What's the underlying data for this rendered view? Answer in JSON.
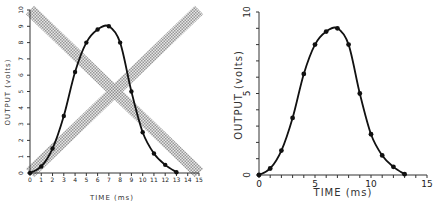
{
  "chart_data": [
    {
      "type": "line",
      "title": "",
      "xlabel": "TIME (ms)",
      "ylabel": "OUTPUT (volts)",
      "xlim": [
        0,
        15
      ],
      "ylim": [
        0,
        10
      ],
      "xticks": [
        "0",
        "1",
        "2",
        "3",
        "4",
        "5",
        "6",
        "7",
        "8",
        "9",
        "10",
        "11",
        "12",
        "13",
        "14",
        "15"
      ],
      "yticks": [
        "0",
        "1",
        "2",
        "3",
        "4",
        "5",
        "6",
        "7",
        "8",
        "9",
        "10"
      ],
      "grid": false,
      "annotations": [
        "Two crossing gray hatched diagonal bands overlaid (X shape): one from (0,10) to (15,0), one from (0,0) to (15,10)"
      ],
      "x": [
        0,
        1,
        2,
        3,
        4,
        5,
        6,
        7,
        8,
        9,
        10,
        11,
        12,
        13
      ],
      "series": [
        {
          "name": "output",
          "values": [
            0,
            0.4,
            1.5,
            3.5,
            6.2,
            8.0,
            8.8,
            9.0,
            8.0,
            5.0,
            2.5,
            1.2,
            0.5,
            0.05
          ]
        }
      ]
    },
    {
      "type": "line",
      "title": "",
      "xlabel": "TIME (ms)",
      "ylabel": "OUTPUT (volts)",
      "xlim": [
        0,
        15
      ],
      "ylim": [
        0,
        10
      ],
      "xticks": [
        "0",
        "5",
        "10",
        "15"
      ],
      "yticks": [
        "0",
        "5",
        "10"
      ],
      "grid": false,
      "x": [
        0,
        1,
        2,
        3,
        4,
        5,
        6,
        7,
        8,
        9,
        10,
        11,
        12,
        13
      ],
      "series": [
        {
          "name": "output",
          "values": [
            0,
            0.4,
            1.5,
            3.5,
            6.2,
            8.0,
            8.8,
            9.0,
            8.0,
            5.0,
            2.5,
            1.2,
            0.5,
            0.05
          ]
        }
      ]
    }
  ],
  "left": {
    "xlabel": "TIME (ms)",
    "ylabel": "OUTPUT (volts)"
  },
  "right": {
    "xlabel": "TIME (ms)",
    "ylabel": "OUTPUT (volts)"
  },
  "colors": {
    "line": "#111111",
    "band": "#9a9a9a",
    "axis": "#333333"
  }
}
